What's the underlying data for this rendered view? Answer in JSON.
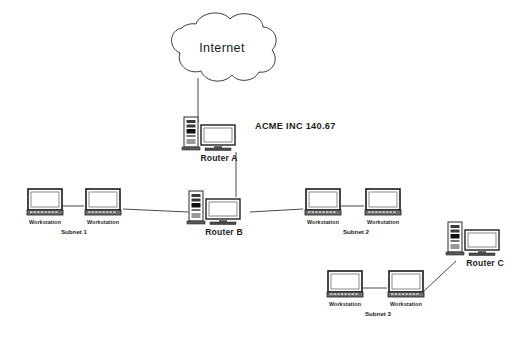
{
  "diagram": {
    "background_color": "#ffffff",
    "line_color": "#4a4a4a",
    "text_color": "#1d1d1d"
  },
  "cloud": {
    "label": "Internet",
    "icon": "cloud-icon"
  },
  "corp": {
    "label": "ACME INC  140.67"
  },
  "routers": [
    {
      "id": "router-a",
      "label": "Router A",
      "icon": "router-tower-monitor-icon"
    },
    {
      "id": "router-b",
      "label": "Router B",
      "icon": "router-tower-monitor-icon"
    },
    {
      "id": "router-c",
      "label": "Router C",
      "icon": "router-tower-monitor-icon"
    }
  ],
  "subnets": [
    {
      "id": "subnet-1",
      "label": "Subnet 1",
      "workstations": [
        {
          "id": "subnet-1-ws-1",
          "label": "Workstation",
          "icon": "workstation-icon"
        },
        {
          "id": "subnet-1-ws-2",
          "label": "Workstation",
          "icon": "workstation-icon"
        }
      ]
    },
    {
      "id": "subnet-2",
      "label": "Subnet 2",
      "workstations": [
        {
          "id": "subnet-2-ws-1",
          "label": "Workstation",
          "icon": "workstation-icon"
        },
        {
          "id": "subnet-2-ws-2",
          "label": "Workstation",
          "icon": "workstation-icon"
        }
      ]
    },
    {
      "id": "subnet-3",
      "label": "Subnet 3",
      "workstations": [
        {
          "id": "subnet-3-ws-1",
          "label": "Workstation",
          "icon": "workstation-icon"
        },
        {
          "id": "subnet-3-ws-2",
          "label": "Workstation",
          "icon": "workstation-icon"
        }
      ]
    }
  ]
}
